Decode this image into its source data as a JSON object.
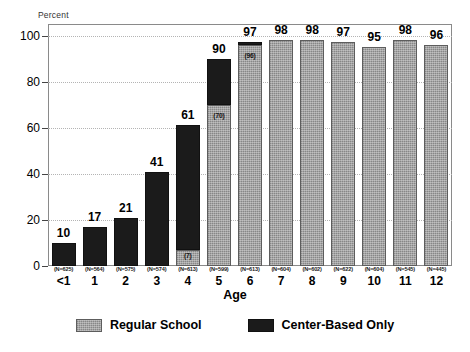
{
  "chart_data": {
    "type": "bar",
    "title": "",
    "subtitle": "",
    "xlabel": "Age",
    "ylabel": "Percent",
    "ylim": [
      0,
      105
    ],
    "yticks": [
      0,
      20,
      40,
      60,
      80,
      100
    ],
    "grid": true,
    "stacked": true,
    "legend_position": "bottom",
    "categories": [
      "<1",
      "1",
      "2",
      "3",
      "4",
      "5",
      "6",
      "7",
      "8",
      "9",
      "10",
      "11",
      "12"
    ],
    "sample_sizes": [
      "(N=625)",
      "(N=564)",
      "(N=575)",
      "(N=574)",
      "(N=613)",
      "(N=599)",
      "(N=613)",
      "(N=604)",
      "(N=602)",
      "(N=622)",
      "(N=604)",
      "(N=545)",
      "(N=445)"
    ],
    "totals": [
      10,
      17,
      21,
      41,
      61,
      90,
      97,
      98,
      98,
      97,
      95,
      98,
      96
    ],
    "series": [
      {
        "name": "Regular School",
        "color": "#9a9a9a",
        "values": [
          0,
          0,
          0,
          0,
          7,
          70,
          96,
          98,
          98,
          97,
          95,
          98,
          96
        ],
        "inbar_labels": [
          "",
          "",
          "",
          "",
          "(7)",
          "(70)",
          "(96)",
          "",
          "",
          "",
          "",
          "",
          ""
        ]
      },
      {
        "name": "Center-Based Only",
        "color": "#1b1b1b",
        "values": [
          10,
          17,
          21,
          41,
          54,
          20,
          1,
          0,
          0,
          0,
          0,
          0,
          0
        ],
        "inbar_labels": [
          "",
          "",
          "",
          "",
          "",
          "",
          "",
          "",
          "",
          "",
          "",
          "",
          ""
        ]
      }
    ]
  },
  "legend": {
    "items": [
      {
        "label": "Regular School",
        "swatch": "gray"
      },
      {
        "label": "Center-Based Only",
        "swatch": "black"
      }
    ]
  },
  "axis": {
    "y_caption": "Percent",
    "x_caption": "Age"
  }
}
